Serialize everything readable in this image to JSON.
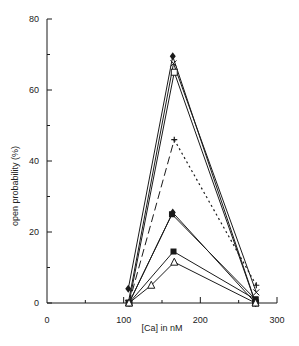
{
  "chart_data": {
    "type": "line",
    "title": "",
    "xlabel": "[Ca] in nM",
    "ylabel": "open probability (%)",
    "xlim": [
      0,
      300
    ],
    "ylim": [
      0,
      80
    ],
    "xticks": [
      0,
      100,
      200,
      300
    ],
    "xminor": [
      50,
      150,
      250
    ],
    "yticks": [
      0,
      20,
      40,
      60,
      80
    ],
    "yminor": [
      10,
      30,
      50,
      70
    ],
    "grid": false,
    "legend": "none",
    "series": [
      {
        "name": "filled diamond",
        "marker": "diamond-filled",
        "style": "solid",
        "x": [
          106,
          164,
          272
        ],
        "values": [
          4,
          69.5,
          0
        ]
      },
      {
        "name": "cross",
        "marker": "x",
        "style": "solid",
        "x": [
          106,
          165,
          273
        ],
        "values": [
          0,
          67.5,
          3
        ]
      },
      {
        "name": "open square",
        "marker": "square-open",
        "style": "solid",
        "x": [
          107,
          166,
          272
        ],
        "values": [
          0,
          65,
          0
        ]
      },
      {
        "name": "plus",
        "marker": "plus",
        "style": "dashed",
        "x": [
          107,
          166,
          273
        ],
        "values": [
          0,
          46,
          5
        ]
      },
      {
        "name": "filled diamond 2",
        "marker": "diamond-filled",
        "style": "solid",
        "x": [
          107,
          164,
          272
        ],
        "values": [
          0,
          25.5,
          0
        ]
      },
      {
        "name": "filled square 2",
        "marker": "square-filled",
        "style": "solid",
        "x": [
          107,
          163,
          272
        ],
        "values": [
          0,
          25,
          1
        ]
      },
      {
        "name": "filled square",
        "marker": "square-filled",
        "style": "solid",
        "x": [
          107,
          165,
          272
        ],
        "values": [
          0,
          14.5,
          1
        ]
      },
      {
        "name": "open triangle",
        "marker": "triangle-open",
        "style": "solid",
        "x": [
          107,
          136,
          166,
          272
        ],
        "values": [
          0,
          5,
          11.5,
          0
        ]
      }
    ]
  }
}
